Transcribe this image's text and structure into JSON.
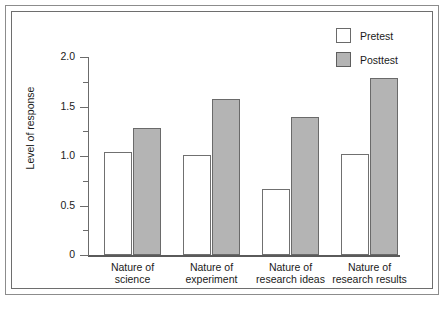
{
  "chart_data": {
    "type": "bar",
    "title": "",
    "xlabel": "",
    "ylabel": "Level of response",
    "ylim": [
      0,
      2.0
    ],
    "grid": false,
    "legend_position": "top-right",
    "categories": [
      "Nature of science",
      "Nature of experiment",
      "Nature of research ideas",
      "Nature of research results"
    ],
    "category_lines": [
      [
        "Nature of",
        "science"
      ],
      [
        "Nature of",
        "experiment"
      ],
      [
        "Nature of",
        "research ideas"
      ],
      [
        "Nature of",
        "research results"
      ]
    ],
    "series": [
      {
        "name": "Pretest",
        "color": "#ffffff",
        "border": "#707070",
        "values": [
          1.04,
          1.01,
          0.67,
          1.02
        ]
      },
      {
        "name": "Posttest",
        "color": "#b4b4b4",
        "border": "#6a6a6a",
        "values": [
          1.28,
          1.58,
          1.39,
          1.79
        ]
      }
    ],
    "y_major_ticks": [
      0,
      0.5,
      1.0,
      1.5,
      2.0
    ],
    "y_major_tick_labels": [
      "0",
      "0.5",
      "1.0",
      "1.5",
      "2.0"
    ],
    "y_minor_ticks": [
      0.25,
      0.75,
      1.25,
      1.75
    ]
  },
  "axis": {
    "y_title": "Level of response",
    "tick_labels": [
      "2.0",
      "1.5",
      "1.0",
      "0.5",
      "0"
    ]
  },
  "legend": {
    "items": [
      {
        "label": "Pretest"
      },
      {
        "label": "Posttest"
      }
    ]
  }
}
